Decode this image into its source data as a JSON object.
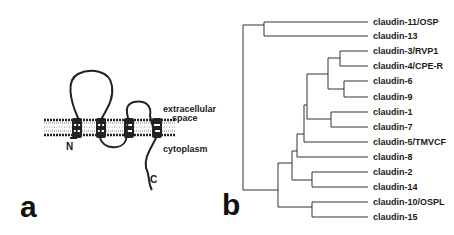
{
  "panel_a": {
    "letter": "a",
    "labels": {
      "extracellular": "extracellular",
      "space": "space",
      "cytoplasm": "cytoplasm",
      "n_terminus": "N",
      "c_terminus": "C"
    }
  },
  "panel_b": {
    "letter": "b",
    "leaves": [
      {
        "label": "claudin-11/OSP",
        "y": 22
      },
      {
        "label": "claudin-13",
        "y": 36
      },
      {
        "label": "claudin-3/RVP1",
        "y": 51
      },
      {
        "label": "claudin-4/CPE-R",
        "y": 66
      },
      {
        "label": "claudin-6",
        "y": 81
      },
      {
        "label": "claudin-9",
        "y": 97
      },
      {
        "label": "claudin-1",
        "y": 112
      },
      {
        "label": "claudin-7",
        "y": 127
      },
      {
        "label": "claudin-5/TMVCF",
        "y": 142
      },
      {
        "label": "claudin-8",
        "y": 157
      },
      {
        "label": "claudin-2",
        "y": 172
      },
      {
        "label": "claudin-14",
        "y": 187
      },
      {
        "label": "claudin-10/OSPL",
        "y": 202
      },
      {
        "label": "claudin-15",
        "y": 217
      }
    ]
  }
}
